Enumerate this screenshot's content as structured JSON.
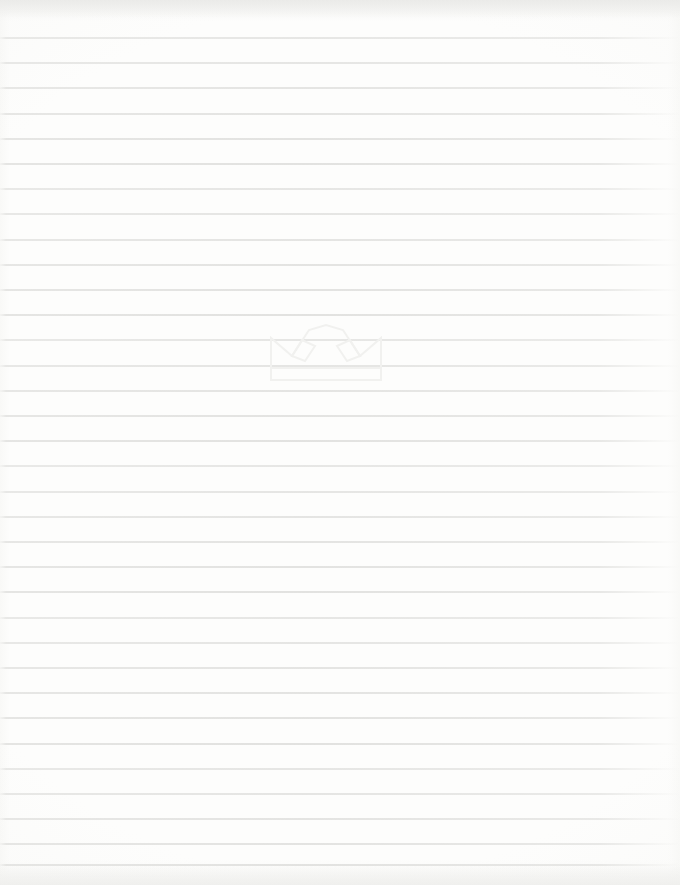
{
  "document": {
    "type": "blank-ruled-paper-scan",
    "title": "",
    "body_text": "",
    "page_width": 680,
    "page_height": 885
  },
  "paper": {
    "background_color": "#fdfdfc",
    "edge_tint_color": "#e9e9e7"
  },
  "ruling": {
    "line_color": "#e4e4e2",
    "line_thickness_px": 2,
    "line_spacing_px": 25.2,
    "first_line_y_px": 37,
    "line_count": 34,
    "left_margin_px": 0,
    "right_fade_px": 672,
    "line_y_positions": [
      37,
      62.2,
      87.4,
      112.6,
      137.8,
      163,
      188.2,
      213.4,
      238.6,
      263.8,
      289,
      314.2,
      339.4,
      364.6,
      389.8,
      415,
      440.2,
      465.4,
      490.6,
      515.8,
      541,
      566.2,
      591.4,
      616.6,
      641.8,
      667,
      692.2,
      717.4,
      742.6,
      767.8,
      793,
      818.2,
      843.4,
      863.6
    ]
  },
  "watermark": {
    "name": "crown-watermark",
    "color": "#f1f1ef",
    "x_px": 266,
    "y_px": 318,
    "width_px": 120,
    "height_px": 68,
    "description": "faint outline of a crown with three peaks, two diamond gems, and a banded base"
  }
}
